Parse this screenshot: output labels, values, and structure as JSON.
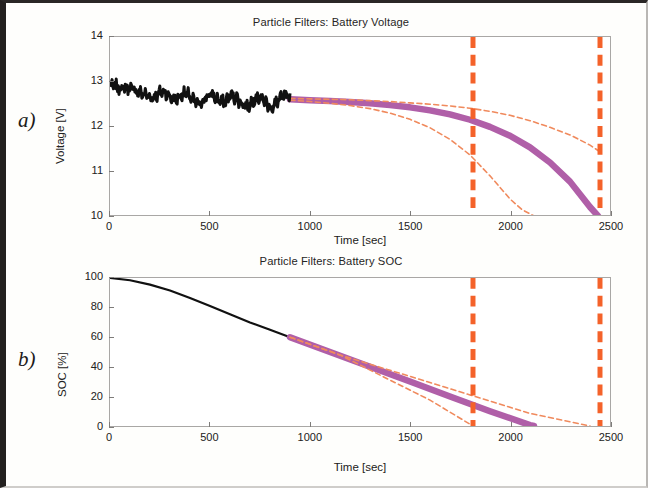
{
  "figure": {
    "panel_a_letter": "a)",
    "panel_b_letter": "b)"
  },
  "colors": {
    "measured": "#111111",
    "prediction": "#b05fa8",
    "bounds": "#f08a5d",
    "eol_marker": "#f4622a",
    "axis": "#a9a7a5",
    "text": "#222120"
  },
  "chart_data": [
    {
      "type": "line",
      "id": "battery-voltage",
      "title": "Particle Filters: Battery Voltage",
      "xlabel": "Time [sec]",
      "ylabel": "Voltage [V]",
      "xlim": [
        0,
        2500
      ],
      "ylim": [
        10,
        14
      ],
      "xticks": [
        0,
        500,
        1000,
        1500,
        2000,
        2500
      ],
      "yticks": [
        10,
        11,
        12,
        13,
        14
      ],
      "grid": false,
      "legend_position": "none",
      "annotations": [
        {
          "name": "eol-threshold-line-left",
          "type": "vline",
          "x": 1815,
          "style": "dashed-thick",
          "color": "#f4622a"
        },
        {
          "name": "eol-threshold-line-right",
          "type": "vline",
          "x": 2450,
          "style": "dashed-thick",
          "color": "#f4622a"
        }
      ],
      "series": [
        {
          "name": "Measured voltage",
          "style": "solid-noisy",
          "color": "#111111",
          "x": [
            0,
            30,
            60,
            90,
            120,
            150,
            180,
            210,
            240,
            270,
            300,
            330,
            360,
            390,
            420,
            450,
            480,
            510,
            540,
            570,
            600,
            630,
            660,
            690,
            720,
            750,
            780,
            810,
            840,
            870,
            900
          ],
          "values": [
            12.92,
            12.88,
            12.84,
            12.87,
            12.82,
            12.74,
            12.7,
            12.62,
            12.72,
            12.78,
            12.66,
            12.58,
            12.72,
            12.7,
            12.55,
            12.48,
            12.66,
            12.7,
            12.58,
            12.52,
            12.68,
            12.64,
            12.5,
            12.44,
            12.62,
            12.66,
            12.52,
            12.4,
            12.58,
            12.66,
            12.62
          ]
        },
        {
          "name": "Predicted voltage (median)",
          "style": "solid-thick",
          "color": "#b05fa8",
          "x": [
            900,
            1000,
            1100,
            1200,
            1300,
            1400,
            1500,
            1600,
            1700,
            1800,
            1900,
            2000,
            2100,
            2200,
            2300,
            2400,
            2440
          ],
          "values": [
            12.6,
            12.58,
            12.56,
            12.54,
            12.51,
            12.47,
            12.42,
            12.35,
            12.26,
            12.14,
            11.98,
            11.78,
            11.52,
            11.18,
            10.75,
            10.18,
            9.98
          ]
        },
        {
          "name": "Upper bound",
          "style": "dashed",
          "color": "#f08a5d",
          "x": [
            900,
            1000,
            1100,
            1200,
            1300,
            1400,
            1500,
            1600,
            1700,
            1800,
            1900,
            2000,
            2100,
            2200,
            2300,
            2400,
            2450
          ],
          "values": [
            12.62,
            12.61,
            12.6,
            12.59,
            12.57,
            12.55,
            12.52,
            12.49,
            12.45,
            12.4,
            12.33,
            12.24,
            12.12,
            11.97,
            11.8,
            11.57,
            11.42
          ]
        },
        {
          "name": "Lower bound",
          "style": "dashed",
          "color": "#f08a5d",
          "x": [
            900,
            1000,
            1100,
            1200,
            1300,
            1400,
            1500,
            1600,
            1700,
            1800,
            1900,
            2000,
            2060,
            2120
          ],
          "values": [
            12.58,
            12.55,
            12.51,
            12.46,
            12.39,
            12.29,
            12.15,
            11.96,
            11.7,
            11.35,
            10.88,
            10.36,
            10.12,
            9.98
          ]
        }
      ]
    },
    {
      "type": "line",
      "id": "battery-soc",
      "title": "Particle Filters: Battery SOC",
      "xlabel": "Time [sec]",
      "ylabel": "SOC [%]",
      "xlim": [
        0,
        2500
      ],
      "ylim": [
        0,
        100
      ],
      "xticks": [
        0,
        500,
        1000,
        1500,
        2000,
        2500
      ],
      "yticks": [
        0,
        20,
        40,
        60,
        80,
        100
      ],
      "grid": false,
      "legend_position": "none",
      "annotations": [
        {
          "name": "eol-threshold-line-left",
          "type": "vline",
          "x": 1815,
          "style": "dashed-thick",
          "color": "#f4622a"
        },
        {
          "name": "eol-threshold-line-right",
          "type": "vline",
          "x": 2450,
          "style": "dashed-thick",
          "color": "#f4622a"
        }
      ],
      "series": [
        {
          "name": "Measured SOC",
          "style": "solid",
          "color": "#111111",
          "x": [
            0,
            100,
            200,
            300,
            400,
            500,
            600,
            700,
            800,
            900
          ],
          "values": [
            100,
            98.5,
            95.5,
            91.5,
            86.5,
            81.0,
            75.5,
            70.0,
            65.0,
            60.0
          ]
        },
        {
          "name": "Predicted SOC (median)",
          "style": "solid-thick",
          "color": "#b05fa8",
          "x": [
            900,
            1100,
            1300,
            1500,
            1700,
            1900,
            2100,
            2120
          ],
          "values": [
            60.0,
            50.0,
            40.0,
            30.0,
            20.0,
            10.0,
            0.6,
            0.0
          ]
        },
        {
          "name": "Upper bound",
          "style": "dashed",
          "color": "#f08a5d",
          "x": [
            900,
            1150,
            1500,
            1800,
            2100,
            2400
          ],
          "values": [
            60.0,
            48.0,
            33.5,
            21.0,
            8.5,
            0.0
          ]
        },
        {
          "name": "Lower bound",
          "style": "dashed",
          "color": "#f08a5d",
          "x": [
            900,
            1150,
            1400,
            1600,
            1815
          ],
          "values": [
            60.0,
            48.0,
            31.0,
            17.5,
            0.0
          ]
        }
      ]
    }
  ]
}
